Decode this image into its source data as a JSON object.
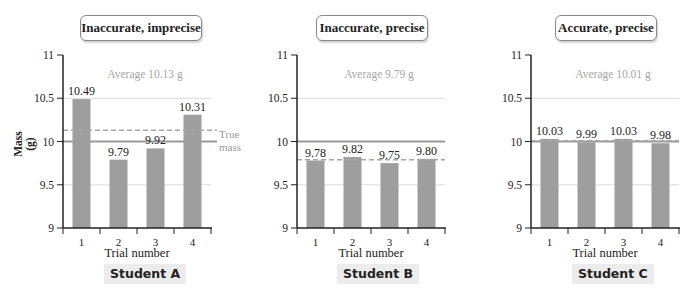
{
  "chart_data": [
    {
      "type": "bar",
      "title": "Inaccurate, imprecise",
      "subtitle": "Student A",
      "categories": [
        "1",
        "2",
        "3",
        "4"
      ],
      "values": [
        10.49,
        9.79,
        9.92,
        10.31
      ],
      "value_labels": [
        "10.49",
        "9.79",
        "9.92",
        "10.31"
      ],
      "average": 10.13,
      "average_label": "Average 10.13 g",
      "true_mass": 10,
      "true_mass_label": [
        "True",
        "mass"
      ],
      "xlabel": "Trial number",
      "ylabel": "Mass (g)",
      "ylim": [
        9,
        11
      ],
      "yticks": [
        "9",
        "9.5",
        "10",
        "10.5",
        "11"
      ],
      "grid": true
    },
    {
      "type": "bar",
      "title": "Inaccurate, precise",
      "subtitle": "Student B",
      "categories": [
        "1",
        "2",
        "3",
        "4"
      ],
      "values": [
        9.78,
        9.82,
        9.75,
        9.8
      ],
      "value_labels": [
        "9.78",
        "9.82",
        "9.75",
        "9.80"
      ],
      "average": 9.79,
      "average_label": "Average 9.79 g",
      "true_mass": 10,
      "xlabel": "Trial number",
      "ylabel": "",
      "ylim": [
        9,
        11
      ],
      "yticks": [
        "9",
        "9.5",
        "10",
        "10.5",
        "11"
      ],
      "grid": true
    },
    {
      "type": "bar",
      "title": "Accurate, precise",
      "subtitle": "Student C",
      "categories": [
        "1",
        "2",
        "3",
        "4"
      ],
      "values": [
        10.03,
        9.99,
        10.03,
        9.98
      ],
      "value_labels": [
        "10.03",
        "9.99",
        "10.03",
        "9.98"
      ],
      "average": 10.01,
      "average_label": "Average 10.01 g",
      "true_mass": 10,
      "xlabel": "Trial number",
      "ylabel": "",
      "ylim": [
        9,
        11
      ],
      "yticks": [
        "9",
        "9.5",
        "10",
        "10.5",
        "11"
      ],
      "grid": true
    }
  ],
  "colors": {
    "bar": "#9e9e9e",
    "grid": "#dcdcdc",
    "true_mass_line": "#9a9a9a",
    "average_line": "#a8a8a8",
    "average_text": "#a6a6a6",
    "axis": "#222222"
  }
}
